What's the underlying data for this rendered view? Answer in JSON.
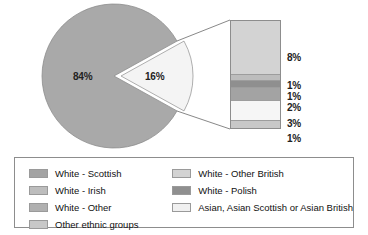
{
  "chart_data": {
    "type": "pie",
    "title": "",
    "subtitle": "",
    "xlabel": "",
    "ylabel": "",
    "legend_position": "bottom",
    "grid": false,
    "pie": {
      "labels": [
        "84%",
        "16%"
      ],
      "values": [
        84,
        16
      ],
      "colors": [
        "#a9a9a9",
        "#f2f2f2"
      ],
      "exploded_index": 1,
      "callout_to": "stacked-bar"
    },
    "stacked_bar": {
      "orientation": "vertical",
      "total": 16,
      "segments": [
        {
          "label": "8%",
          "value": 8,
          "category": "White - Other British",
          "color": "#d3d3d3"
        },
        {
          "label": "1%",
          "value": 1,
          "category": "White - Irish",
          "color": "#bdbdbd"
        },
        {
          "label": "1%",
          "value": 1,
          "category": "White - Polish",
          "color": "#8f8f8f"
        },
        {
          "label": "2%",
          "value": 2,
          "category": "White - Scottish",
          "color": "#a3a3a3"
        },
        {
          "label": "3%",
          "value": 3,
          "category": "Asian, Asian Scottish or Asian British",
          "color": "#f6f6f6"
        },
        {
          "label": "1%",
          "value": 1,
          "category": "Other ethnic groups",
          "color": "#c8c8c8"
        }
      ]
    },
    "legend": {
      "columns": [
        {
          "items": [
            {
              "label": "White - Scottish",
              "color": "#a3a3a3"
            },
            {
              "label": "White - Irish",
              "color": "#bdbdbd"
            },
            {
              "label": "White - Other",
              "color": "#b0b0b0"
            },
            {
              "label": "Other ethnic groups",
              "color": "#c8c8c8"
            }
          ]
        },
        {
          "items": [
            {
              "label": "White - Other British",
              "color": "#d3d3d3"
            },
            {
              "label": "White - Polish",
              "color": "#8f8f8f"
            },
            {
              "label": "Asian, Asian Scottish or Asian British",
              "color": "#f0f0f0"
            }
          ]
        }
      ]
    }
  }
}
